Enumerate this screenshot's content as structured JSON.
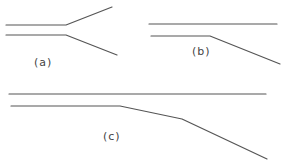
{
  "figure": {
    "line_color": "#555555",
    "label_color": "#444444",
    "panels": [
      {
        "id": "a",
        "label": "(a)",
        "description": "Two parallel lines diverging at a branch point into a Y shape",
        "upper_path": [
          [
            6,
            25
          ],
          [
            66,
            25
          ],
          [
            112,
            7
          ]
        ],
        "lower_path": [
          [
            6,
            35
          ],
          [
            66,
            35
          ],
          [
            117,
            55
          ]
        ],
        "label_pos": [
          34,
          66
        ]
      },
      {
        "id": "b",
        "label": "(b)",
        "description": "Upper line continues straight; lower line bends downward once",
        "upper_path": [
          [
            149,
            24
          ],
          [
            277,
            24
          ]
        ],
        "lower_path": [
          [
            151,
            36
          ],
          [
            210,
            36
          ],
          [
            280,
            64
          ]
        ],
        "label_pos": [
          192,
          55
        ]
      },
      {
        "id": "c",
        "label": "(c)",
        "description": "Upper line continues straight; lower line bends downward in two stages",
        "upper_path": [
          [
            9,
            94
          ],
          [
            266,
            94
          ]
        ],
        "lower_path": [
          [
            11,
            106
          ],
          [
            120,
            106
          ],
          [
            182,
            119
          ],
          [
            267,
            159
          ]
        ],
        "label_pos": [
          103,
          140
        ]
      }
    ]
  }
}
